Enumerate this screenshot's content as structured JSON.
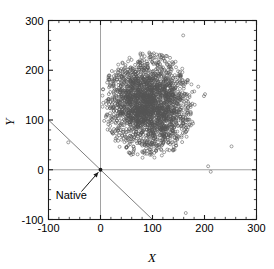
{
  "figure": {
    "background": "#ffffff",
    "frame_color": "#1a1a1a",
    "marker_color": "#555555",
    "reference_line_color": "#8a8a8a",
    "diagonal_line_color": "#6e6e6e"
  },
  "chart_data": {
    "type": "scatter",
    "title": "",
    "xlabel": "X",
    "ylabel": "Y",
    "xlim": [
      -100,
      300
    ],
    "ylim": [
      -100,
      300
    ],
    "xticks": [
      -100,
      0,
      100,
      200,
      300
    ],
    "xtick_labels": [
      "-100",
      "0",
      "100",
      "200",
      "300"
    ],
    "yticks": [
      -100,
      0,
      100,
      200,
      300
    ],
    "ytick_labels": [
      "-100",
      "0",
      "100",
      "200",
      "300"
    ],
    "minor_tick_interval": 20,
    "grid": false,
    "legend": null,
    "marker_style": "open-circle",
    "marker_size": 2.1,
    "n_points": 2400,
    "cluster": {
      "center_x": 92,
      "center_y": 130,
      "sd_x": 41,
      "sd_y": 48,
      "correlation": -0.12
    },
    "reference_lines": [
      {
        "name": "x-zero",
        "type": "vertical",
        "value": 0
      },
      {
        "name": "y-zero",
        "type": "horizontal",
        "value": 0
      }
    ],
    "annotation_lines": [
      {
        "name": "diagonal",
        "x1": -100,
        "y1": 100,
        "x2": 100,
        "y2": -100,
        "slope": -1
      }
    ],
    "annotations": [
      {
        "name": "native",
        "label": "Native",
        "point_x": 0,
        "point_y": 0,
        "label_x": -56,
        "label_y": -50
      }
    ],
    "outliers": [
      {
        "x": 252,
        "y": 47
      },
      {
        "x": 207,
        "y": 7
      },
      {
        "x": 212,
        "y": -4
      },
      {
        "x": 164,
        "y": -87
      },
      {
        "x": 159,
        "y": 270
      },
      {
        "x": -62,
        "y": 55
      },
      {
        "x": 199,
        "y": 148
      },
      {
        "x": 201,
        "y": 152
      },
      {
        "x": 188,
        "y": 167
      }
    ]
  },
  "axes": {
    "x_title": "X",
    "y_title": "Y"
  }
}
